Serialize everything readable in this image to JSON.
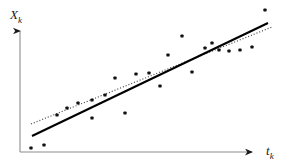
{
  "figure": {
    "title": "",
    "background_color": "#ffffff"
  },
  "axes": {
    "y_label": "X",
    "y_label_sub": "k",
    "x_label": "t",
    "x_label_sub": "k",
    "axis_color": "#8c8c8c",
    "arrow_color": "#1a1a1a",
    "y_axis": {
      "x": 20,
      "y_top": 30,
      "y_bottom": 152
    },
    "x_axis": {
      "y": 152,
      "x_left": 20,
      "x_right": 254
    }
  },
  "series": {
    "points": {
      "name": "observations",
      "marker": "square-dot",
      "color": "#111111",
      "size": 3.2
    },
    "fit_line": {
      "name": "least-squares-fit",
      "style": "solid",
      "color": "#000000",
      "width": 2.1,
      "x1": 32,
      "y1": 136,
      "x2": 268,
      "y2": 23
    },
    "reference_line": {
      "name": "true-regression-line",
      "style": "dotted",
      "color": "#555555",
      "width": 1.2,
      "x1": 31,
      "y1": 124,
      "x2": 272,
      "y2": 27
    }
  },
  "chart_data": {
    "type": "scatter",
    "title": "",
    "xlabel": "t_k",
    "ylabel": "X_k",
    "grid": false,
    "legend": "none",
    "axis_arrows": true,
    "xlim": [
      20,
      291
    ],
    "ylim": [
      0,
      168
    ],
    "note": "Pixel coordinates: x increases rightward, y increases downward within the 291x168 canvas.",
    "points_px": [
      [
        31,
        148
      ],
      [
        44,
        145
      ],
      [
        57,
        115
      ],
      [
        67,
        108
      ],
      [
        78,
        103
      ],
      [
        92,
        118
      ],
      [
        92,
        100
      ],
      [
        105,
        95
      ],
      [
        115,
        78
      ],
      [
        125,
        113
      ],
      [
        136,
        74
      ],
      [
        149,
        73
      ],
      [
        160,
        86
      ],
      [
        168,
        55
      ],
      [
        182,
        36
      ],
      [
        192,
        72
      ],
      [
        205,
        48
      ],
      [
        212,
        43
      ],
      [
        219,
        50
      ],
      [
        229,
        51
      ],
      [
        240,
        50
      ],
      [
        252,
        47
      ],
      [
        265,
        10
      ]
    ],
    "series": [
      {
        "name": "data points",
        "marker": "filled-square",
        "x": [
          31,
          44,
          57,
          67,
          78,
          92,
          92,
          105,
          115,
          125,
          136,
          149,
          160,
          168,
          182,
          192,
          205,
          212,
          219,
          229,
          240,
          252,
          265
        ],
        "y": [
          148,
          145,
          115,
          108,
          103,
          118,
          100,
          95,
          78,
          113,
          74,
          73,
          86,
          55,
          36,
          72,
          48,
          43,
          50,
          51,
          50,
          47,
          10
        ]
      },
      {
        "name": "solid fit line",
        "type": "line",
        "style": "solid",
        "x": [
          32,
          268
        ],
        "y": [
          136,
          23
        ]
      },
      {
        "name": "dotted reference line",
        "type": "line",
        "style": "dotted",
        "x": [
          31,
          272
        ],
        "y": [
          124,
          27
        ]
      }
    ]
  }
}
